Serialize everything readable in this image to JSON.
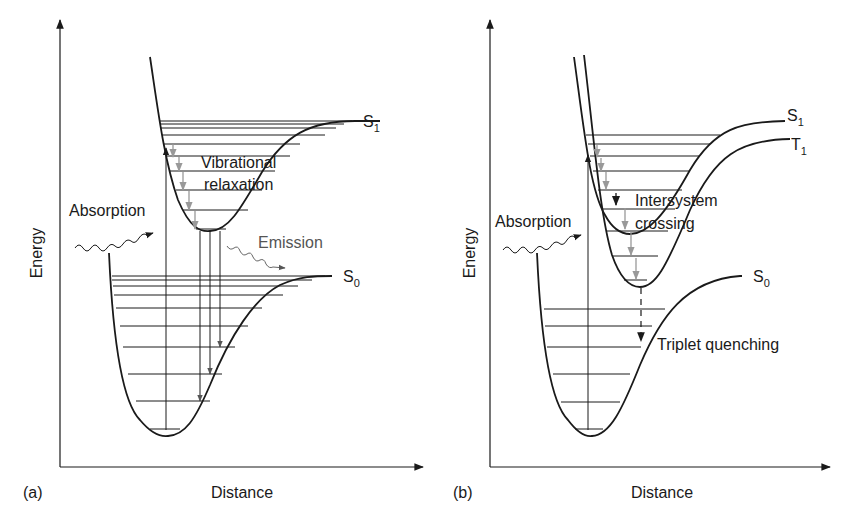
{
  "figure": {
    "panels": [
      {
        "id": "a",
        "panel_label": "(a)",
        "x_axis_label": "Distance",
        "y_axis_label": "Energy",
        "curves": [
          {
            "name": "S",
            "subscript": "1"
          },
          {
            "name": "S",
            "subscript": "0"
          }
        ],
        "annotations": {
          "absorption": "Absorption",
          "vibrational_line1": "Vibrational",
          "vibrational_line2": "relaxation",
          "emission": "Emission"
        }
      },
      {
        "id": "b",
        "panel_label": "(b)",
        "x_axis_label": "Distance",
        "y_axis_label": "Energy",
        "curves": [
          {
            "name": "S",
            "subscript": "1"
          },
          {
            "name": "T",
            "subscript": "1"
          },
          {
            "name": "S",
            "subscript": "0"
          }
        ],
        "annotations": {
          "absorption": "Absorption",
          "isc_line1": "Intersystem",
          "isc_line2": "crossing",
          "triplet_quenching": "Triplet quenching"
        }
      }
    ],
    "colors": {
      "ink": "#1a1a1a",
      "relaxation_arrows": "#999999",
      "emission_text": "#555555"
    }
  }
}
